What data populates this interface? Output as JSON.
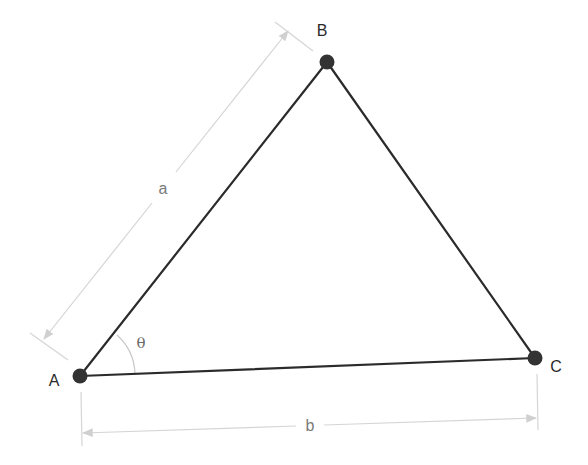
{
  "diagram": {
    "type": "triangle",
    "colors": {
      "edge": "#2b2b2b",
      "vertex": "#333333",
      "dimension": "#cfcfcf",
      "label": "#2a2a2a",
      "dimension_label": "#7a7a7a"
    },
    "vertices": [
      {
        "id": "A",
        "label": "A",
        "x": 80,
        "y": 376
      },
      {
        "id": "B",
        "label": "B",
        "x": 327,
        "y": 62
      },
      {
        "id": "C",
        "label": "C",
        "x": 535,
        "y": 358
      }
    ],
    "edges": [
      {
        "from": "A",
        "to": "B"
      },
      {
        "from": "B",
        "to": "C"
      },
      {
        "from": "A",
        "to": "C"
      }
    ],
    "dimensions": [
      {
        "id": "a",
        "label": "a",
        "between": [
          "A",
          "B"
        ]
      },
      {
        "id": "b",
        "label": "b",
        "between": [
          "A",
          "C"
        ]
      }
    ],
    "angle": {
      "label": "θ",
      "at": "A"
    }
  }
}
